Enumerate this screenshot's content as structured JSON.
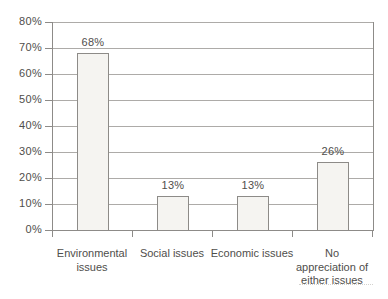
{
  "chart_data": {
    "type": "bar",
    "categories": [
      "Environmental issues",
      "Social issues",
      "Economic issues",
      "No appreciation of either issues"
    ],
    "values": [
      68,
      13,
      13,
      26
    ],
    "data_labels": [
      "68%",
      "13%",
      "13%",
      "26%"
    ],
    "category_label_lines": [
      [
        "Environmental",
        "issues"
      ],
      [
        "Social issues"
      ],
      [
        "Economic issues"
      ],
      [
        "No",
        "appreciation of",
        "either issues"
      ]
    ],
    "ylim": [
      0,
      80
    ],
    "y_ticks": [
      {
        "value": 0,
        "label": "0%"
      },
      {
        "value": 10,
        "label": "10%"
      },
      {
        "value": 20,
        "label": "20%"
      },
      {
        "value": 30,
        "label": "30%"
      },
      {
        "value": 40,
        "label": "40%"
      },
      {
        "value": 50,
        "label": "50%"
      },
      {
        "value": 60,
        "label": "60%"
      },
      {
        "value": 70,
        "label": "70%"
      },
      {
        "value": 80,
        "label": "80%"
      }
    ],
    "grid": true,
    "legend": false,
    "colors": {
      "bar_fill": "#f5f4f1",
      "bar_border": "#8d8b88",
      "grid_line": "#adaba8",
      "axis_line": "#8d8b88",
      "text": "#4f4e4b",
      "background": "#ffffff"
    }
  }
}
